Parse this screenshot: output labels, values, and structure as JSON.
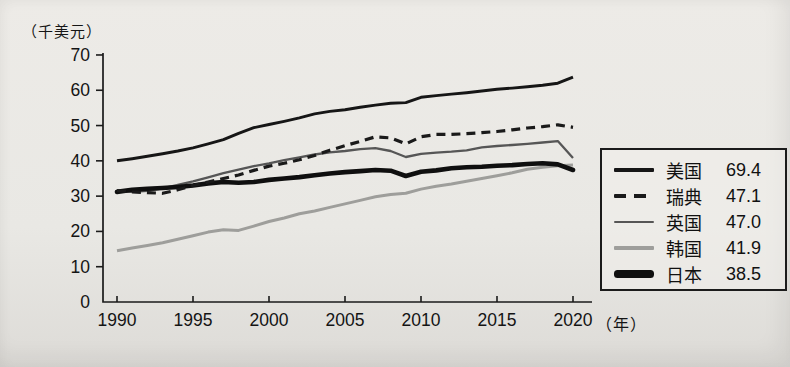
{
  "page": {
    "background": "#e9e8e4",
    "ink": "#1b1b1b"
  },
  "y_axis": {
    "unit_label": "（千美元）",
    "ticks": [
      0,
      10,
      20,
      30,
      40,
      50,
      60,
      70
    ]
  },
  "x_axis": {
    "unit_label": "（年）",
    "ticks": [
      1990,
      1995,
      2000,
      2005,
      2010,
      2015,
      2020
    ]
  },
  "chart_data": {
    "type": "line",
    "title": "",
    "ylabel": "千美元",
    "xlabel": "年",
    "ylim": [
      0,
      70
    ],
    "xlim": [
      1990,
      2020
    ],
    "grid": false,
    "legend_position": "right",
    "x": [
      1990,
      1991,
      1992,
      1993,
      1994,
      1995,
      1996,
      1997,
      1998,
      1999,
      2000,
      2001,
      2002,
      2003,
      2004,
      2005,
      2006,
      2007,
      2008,
      2009,
      2010,
      2011,
      2012,
      2013,
      2014,
      2015,
      2016,
      2017,
      2018,
      2019,
      2020
    ],
    "series": [
      {
        "key": "usa",
        "name": "美国",
        "legend_value": "69.4",
        "color": "#161616",
        "width": 2.9,
        "dash": "",
        "cap": "butt",
        "values": [
          40.0,
          40.6,
          41.3,
          42.0,
          42.8,
          43.7,
          44.8,
          46.0,
          47.8,
          49.4,
          50.3,
          51.2,
          52.2,
          53.3,
          54.0,
          54.5,
          55.2,
          55.8,
          56.3,
          56.5,
          58.0,
          58.5,
          58.9,
          59.3,
          59.8,
          60.3,
          60.6,
          61.0,
          61.4,
          62.0,
          63.7
        ]
      },
      {
        "key": "sweden",
        "name": "瑞典",
        "legend_value": "47.1",
        "color": "#1a1a1a",
        "width": 3.2,
        "dash": "9 6",
        "cap": "butt",
        "values": [
          31.6,
          31.2,
          31.0,
          30.8,
          31.8,
          33.0,
          34.0,
          35.0,
          36.0,
          37.3,
          38.5,
          39.3,
          40.3,
          41.5,
          43.0,
          44.3,
          45.5,
          46.8,
          46.5,
          44.8,
          46.8,
          47.5,
          47.5,
          47.7,
          48.0,
          48.3,
          48.8,
          49.3,
          49.7,
          50.2,
          49.5
        ]
      },
      {
        "key": "uk",
        "name": "英国",
        "legend_value": "47.0",
        "color": "#565656",
        "width": 2.3,
        "dash": "",
        "cap": "butt",
        "values": [
          31.4,
          31.2,
          31.5,
          32.2,
          33.2,
          34.2,
          35.3,
          36.5,
          37.5,
          38.5,
          39.3,
          40.2,
          41.0,
          41.8,
          42.4,
          42.8,
          43.3,
          43.6,
          42.8,
          41.1,
          42.0,
          42.3,
          42.6,
          43.0,
          43.8,
          44.2,
          44.5,
          44.8,
          45.2,
          45.6,
          40.8
        ]
      },
      {
        "key": "korea",
        "name": "韩国",
        "legend_value": "41.9",
        "color": "#9e9e9b",
        "width": 3.0,
        "dash": "",
        "cap": "butt",
        "values": [
          14.5,
          15.3,
          16.0,
          16.8,
          17.8,
          18.8,
          19.8,
          20.5,
          20.3,
          21.5,
          22.8,
          23.8,
          25.0,
          25.8,
          26.8,
          27.8,
          28.8,
          29.8,
          30.5,
          30.8,
          32.0,
          32.8,
          33.4,
          34.2,
          35.0,
          35.8,
          36.6,
          37.6,
          38.2,
          38.6,
          38.8
        ]
      },
      {
        "key": "japan",
        "name": "日本",
        "legend_value": "38.5",
        "color": "#0f0f0f",
        "width": 4.6,
        "dash": "",
        "cap": "round",
        "values": [
          31.2,
          31.8,
          32.1,
          32.3,
          32.6,
          33.0,
          33.6,
          34.0,
          33.8,
          34.0,
          34.6,
          35.0,
          35.4,
          35.9,
          36.4,
          36.8,
          37.1,
          37.4,
          37.2,
          35.7,
          36.9,
          37.3,
          37.9,
          38.2,
          38.3,
          38.6,
          38.8,
          39.1,
          39.3,
          39.0,
          37.4
        ]
      }
    ]
  },
  "legend": {
    "border_color": "#1b1b1b"
  }
}
